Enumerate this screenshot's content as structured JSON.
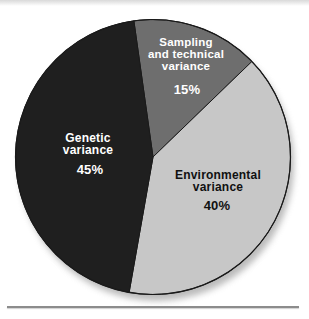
{
  "figure": {
    "background": "#ffffff",
    "outline_color": "#1a1a1a",
    "shadow_color": "#979797",
    "bottom_rule_color": "#8c8c8c"
  },
  "chart_data": {
    "type": "pie",
    "title": "",
    "legend": "none",
    "unit": "percent",
    "categories": [
      "Sampling and technical variance",
      "Environmental variance",
      "Genetic variance"
    ],
    "values": [
      15,
      40,
      45
    ],
    "start_angle_deg": -8,
    "direction": "clockwise",
    "slices": [
      {
        "name": "Sampling and technical variance",
        "label_lines": "Sampling\nand technical\nvariance",
        "pct_label": "15%",
        "value": 15,
        "color": "#6e6e6e",
        "text_color": "#ffffff"
      },
      {
        "name": "Environmental variance",
        "label_lines": "Environmental\nvariance",
        "pct_label": "40%",
        "value": 40,
        "color": "#c7c7c7",
        "text_color": "#111111"
      },
      {
        "name": "Genetic variance",
        "label_lines": "Genetic\nvariance",
        "pct_label": "45%",
        "value": 45,
        "color": "#1f1f1f",
        "text_color": "#ffffff"
      }
    ]
  }
}
